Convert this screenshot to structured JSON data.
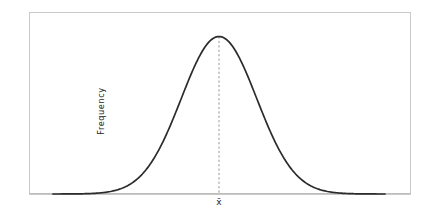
{
  "figure": {
    "background_color": "#ffffff",
    "width": 427,
    "height": 222
  },
  "axes": {
    "frame_color": "#c9c9c9",
    "frame_left": 29,
    "frame_top": 12,
    "frame_right": 410,
    "frame_bottom": 194,
    "ylabel": "Frequency",
    "xlabel": ""
  },
  "annotations": {
    "mean_tick_label": "x̄",
    "mean_tick_x": 217,
    "mean_line_color": "#8a8a8a"
  },
  "curve": {
    "color": "#2b2b2b",
    "stroke_width": 1.7
  },
  "chart_data": {
    "type": "line",
    "title": "",
    "xlabel": "",
    "ylabel": "Frequency",
    "grid": false,
    "legend": null,
    "xlim": [
      -4.4,
      4.4
    ],
    "ylim": [
      0,
      1.08
    ],
    "annotations": [
      {
        "label": "x̄",
        "x": 0,
        "type": "vertical-dashed-line",
        "from_y": 0,
        "to_y": 1.0,
        "description": "dashed vertical line from baseline to curve peak marking the mean"
      }
    ],
    "series": [
      {
        "name": "Normal distribution",
        "description": "Symmetric bell-shaped normal (Gaussian) frequency curve, mean 0, peak height 1",
        "mean": 0,
        "sigma": 1,
        "peak_value": 1.0,
        "x": [
          -4.4,
          -4.2,
          -4.0,
          -3.8,
          -3.6,
          -3.4,
          -3.2,
          -3.0,
          -2.8,
          -2.6,
          -2.4,
          -2.2,
          -2.0,
          -1.8,
          -1.6,
          -1.4,
          -1.2,
          -1.0,
          -0.8,
          -0.6,
          -0.4,
          -0.2,
          0.0,
          0.2,
          0.4,
          0.6,
          0.8,
          1.0,
          1.2,
          1.4,
          1.6,
          1.8,
          2.0,
          2.2,
          2.4,
          2.6,
          2.8,
          3.0,
          3.2,
          3.4,
          3.6,
          3.8,
          4.0,
          4.2,
          4.4
        ],
        "values": [
          0.0,
          0.0,
          0.0,
          0.001,
          0.002,
          0.003,
          0.006,
          0.011,
          0.02,
          0.034,
          0.056,
          0.089,
          0.135,
          0.198,
          0.278,
          0.375,
          0.487,
          0.607,
          0.726,
          0.835,
          0.923,
          0.98,
          1.0,
          0.98,
          0.923,
          0.835,
          0.726,
          0.607,
          0.487,
          0.375,
          0.278,
          0.198,
          0.135,
          0.089,
          0.056,
          0.034,
          0.02,
          0.011,
          0.006,
          0.003,
          0.002,
          0.001,
          0.0,
          0.0,
          0.0
        ]
      }
    ]
  }
}
